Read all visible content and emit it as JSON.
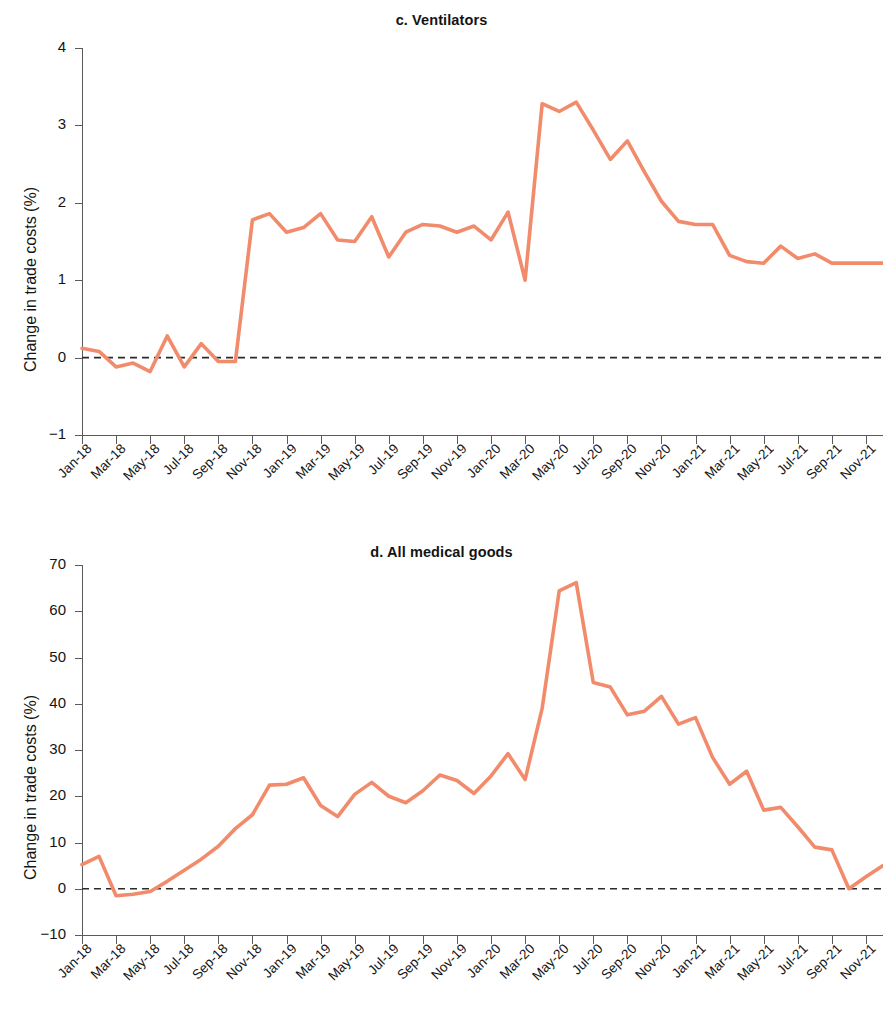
{
  "figure": {
    "ylabel": "Change in trade costs (%)",
    "line_color": "#F28B6B",
    "zero_line_color": "#2b2b2b"
  },
  "chart_data": [
    {
      "type": "line",
      "panel": "c",
      "title": "c. Ventilators",
      "xlabel": "",
      "ylabel": "Change in trade costs (%)",
      "ylim": [
        -1,
        4
      ],
      "yticks": [
        -1,
        0,
        1,
        2,
        3,
        4
      ],
      "ytick_labels": [
        "−1",
        "0",
        "1",
        "2",
        "3",
        "4"
      ],
      "grid": false,
      "legend": "none",
      "zero_reference_line": 0,
      "categories": [
        "Jan-18",
        "Feb-18",
        "Mar-18",
        "Apr-18",
        "May-18",
        "Jun-18",
        "Jul-18",
        "Aug-18",
        "Sep-18",
        "Oct-18",
        "Nov-18",
        "Dec-18",
        "Jan-19",
        "Feb-19",
        "Mar-19",
        "Apr-19",
        "May-19",
        "Jun-19",
        "Jul-19",
        "Aug-19",
        "Sep-19",
        "Oct-19",
        "Nov-19",
        "Dec-19",
        "Jan-20",
        "Feb-20",
        "Mar-20",
        "Apr-20",
        "May-20",
        "Jun-20",
        "Jul-20",
        "Aug-20",
        "Sep-20",
        "Oct-20",
        "Nov-20",
        "Dec-20",
        "Jan-21",
        "Feb-21",
        "Mar-21",
        "Apr-21",
        "May-21",
        "Jun-21",
        "Jul-21",
        "Aug-21",
        "Sep-21",
        "Oct-21",
        "Nov-21",
        "Dec-21"
      ],
      "tick_categories": [
        "Jan-18",
        "Mar-18",
        "May-18",
        "Jul-18",
        "Sep-18",
        "Nov-18",
        "Jan-19",
        "Mar-19",
        "May-19",
        "Jul-19",
        "Sep-19",
        "Nov-19",
        "Jan-20",
        "Mar-20",
        "May-20",
        "Jul-20",
        "Sep-20",
        "Nov-20",
        "Jan-21",
        "Mar-21",
        "May-21",
        "Jul-21",
        "Sep-21",
        "Nov-21"
      ],
      "values": [
        0.12,
        0.08,
        -0.12,
        -0.07,
        -0.18,
        0.28,
        -0.12,
        0.18,
        -0.05,
        -0.05,
        1.78,
        1.86,
        1.62,
        1.68,
        1.86,
        1.52,
        1.5,
        1.82,
        1.3,
        1.62,
        1.72,
        1.7,
        1.62,
        1.7,
        1.52,
        1.88,
        1.0,
        3.28,
        3.18,
        3.3,
        2.94,
        2.56,
        2.8,
        2.4,
        2.02,
        1.76,
        1.72,
        1.72,
        1.32,
        1.24,
        1.22,
        1.44,
        1.28,
        1.34,
        1.22,
        1.22,
        1.22,
        1.22
      ]
    },
    {
      "type": "line",
      "panel": "d",
      "title": "d. All medical goods",
      "xlabel": "",
      "ylabel": "Change in trade costs (%)",
      "ylim": [
        -10,
        70
      ],
      "yticks": [
        -10,
        0,
        10,
        20,
        30,
        40,
        50,
        60,
        70
      ],
      "ytick_labels": [
        "−10",
        "0",
        "10",
        "20",
        "30",
        "40",
        "50",
        "60",
        "70"
      ],
      "grid": false,
      "legend": "none",
      "zero_reference_line": 0,
      "categories": [
        "Jan-18",
        "Feb-18",
        "Mar-18",
        "Apr-18",
        "May-18",
        "Jun-18",
        "Jul-18",
        "Aug-18",
        "Sep-18",
        "Oct-18",
        "Nov-18",
        "Dec-18",
        "Jan-19",
        "Feb-19",
        "Mar-19",
        "Apr-19",
        "May-19",
        "Jun-19",
        "Jul-19",
        "Aug-19",
        "Sep-19",
        "Oct-19",
        "Nov-19",
        "Dec-19",
        "Jan-20",
        "Feb-20",
        "Mar-20",
        "Apr-20",
        "May-20",
        "Jun-20",
        "Jul-20",
        "Aug-20",
        "Sep-20",
        "Oct-20",
        "Nov-20",
        "Dec-20",
        "Jan-21",
        "Feb-21",
        "Mar-21",
        "Apr-21",
        "May-21",
        "Jun-21",
        "Jul-21",
        "Aug-21",
        "Sep-21",
        "Oct-21",
        "Nov-21",
        "Dec-21"
      ],
      "tick_categories": [
        "Jan-18",
        "Mar-18",
        "May-18",
        "Jul-18",
        "Sep-18",
        "Nov-18",
        "Jan-19",
        "Mar-19",
        "May-19",
        "Jul-19",
        "Sep-19",
        "Nov-19",
        "Jan-20",
        "Mar-20",
        "May-20",
        "Jul-20",
        "Sep-20",
        "Nov-20",
        "Jan-21",
        "Mar-21",
        "May-21",
        "Jul-21",
        "Sep-21",
        "Nov-21"
      ],
      "values": [
        5.2,
        7.0,
        -1.5,
        -1.2,
        -0.6,
        1.6,
        4.0,
        6.4,
        9.2,
        13.0,
        16.0,
        22.4,
        22.6,
        24.0,
        18.0,
        15.6,
        20.4,
        23.0,
        20.0,
        18.6,
        21.2,
        24.6,
        23.4,
        20.6,
        24.4,
        29.2,
        23.6,
        39.0,
        64.4,
        66.2,
        44.6,
        43.6,
        37.6,
        38.4,
        41.6,
        35.6,
        37.0,
        28.4,
        22.6,
        25.4,
        17.0,
        17.6,
        13.4,
        9.0,
        8.4,
        0.0,
        2.6,
        5.0
      ]
    }
  ]
}
